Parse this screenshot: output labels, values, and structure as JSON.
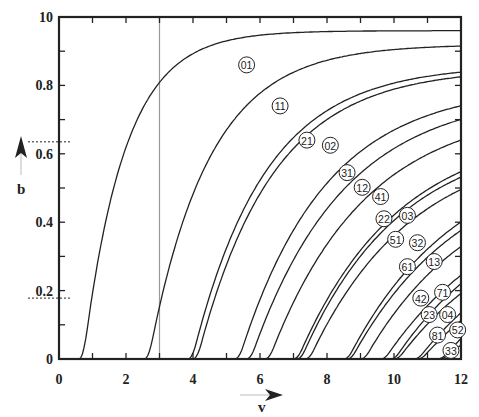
{
  "chart_data": {
    "type": "line",
    "title": "",
    "xlabel": "v",
    "ylabel": "b",
    "xlim": [
      0,
      12
    ],
    "ylim": [
      0,
      1.0
    ],
    "x_ticks": [
      0,
      2,
      4,
      6,
      8,
      10,
      12
    ],
    "x_tick_labels": [
      "0",
      "2",
      "4",
      "6",
      "8",
      "10",
      "12"
    ],
    "y_ticks": [
      0,
      0.2,
      0.4,
      0.6,
      0.8,
      1.0
    ],
    "y_tick_labels": [
      "0",
      "0.2",
      "0.4",
      "0.6",
      "0.8",
      "10"
    ],
    "grid": false,
    "legend": "inline circled labels on curves",
    "reference_lines": {
      "vertical_v": 3.0,
      "vertical_color": "#999999",
      "dashed_b_upper": 0.635,
      "dashed_b_lower": 0.178
    },
    "series": [
      {
        "name": "01",
        "v_start": 0.6,
        "b_end": 0.96,
        "k": 0.58,
        "label_at": [
          5.6,
          0.86
        ]
      },
      {
        "name": "11",
        "v_start": 2.55,
        "b_end": 0.92,
        "k": 0.4,
        "label_at": [
          6.6,
          0.74
        ]
      },
      {
        "name": "21",
        "v_start": 3.85,
        "b_end": 0.86,
        "k": 0.33,
        "label_at": [
          7.4,
          0.64
        ]
      },
      {
        "name": "02",
        "v_start": 4.0,
        "b_end": 0.85,
        "k": 0.32,
        "label_at": [
          8.1,
          0.625
        ]
      },
      {
        "name": "31",
        "v_start": 5.25,
        "b_end": 0.8,
        "k": 0.28,
        "label_at": [
          8.6,
          0.545
        ]
      },
      {
        "name": "12",
        "v_start": 5.6,
        "b_end": 0.78,
        "k": 0.26,
        "label_at": [
          9.05,
          0.502
        ]
      },
      {
        "name": "41",
        "v_start": 6.15,
        "b_end": 0.74,
        "k": 0.25,
        "label_at": [
          9.6,
          0.475
        ]
      },
      {
        "name": "22",
        "v_start": 7.0,
        "b_end": 0.68,
        "k": 0.24,
        "label_at": [
          9.7,
          0.41
        ]
      },
      {
        "name": "03",
        "v_start": 7.1,
        "b_end": 0.66,
        "k": 0.245,
        "label_at": [
          10.4,
          0.42
        ]
      },
      {
        "name": "51",
        "v_start": 7.35,
        "b_end": 0.64,
        "k": 0.235,
        "label_at": [
          10.05,
          0.35
        ]
      },
      {
        "name": "32",
        "v_start": 8.5,
        "b_end": 0.62,
        "k": 0.22,
        "label_at": [
          10.7,
          0.34
        ]
      },
      {
        "name": "61",
        "v_start": 8.6,
        "b_end": 0.6,
        "k": 0.215,
        "label_at": [
          10.4,
          0.27
        ]
      },
      {
        "name": "13",
        "v_start": 9.0,
        "b_end": 0.56,
        "k": 0.22,
        "label_at": [
          11.2,
          0.285
        ]
      },
      {
        "name": "42",
        "v_start": 9.6,
        "b_end": 0.52,
        "k": 0.2,
        "label_at": [
          10.8,
          0.178
        ]
      },
      {
        "name": "71",
        "v_start": 9.9,
        "b_end": 0.5,
        "k": 0.21,
        "label_at": [
          11.45,
          0.195
        ]
      },
      {
        "name": "23",
        "v_start": 10.0,
        "b_end": 0.47,
        "k": 0.2,
        "label_at": [
          11.05,
          0.13
        ]
      },
      {
        "name": "04",
        "v_start": 10.6,
        "b_end": 0.45,
        "k": 0.2,
        "label_at": [
          11.6,
          0.13
        ]
      },
      {
        "name": "81",
        "v_start": 10.7,
        "b_end": 0.4,
        "k": 0.2,
        "label_at": [
          11.3,
          0.07
        ]
      },
      {
        "name": "52",
        "v_start": 11.3,
        "b_end": 0.4,
        "k": 0.2,
        "label_at": [
          11.9,
          0.085
        ]
      },
      {
        "name": "33",
        "v_start": 11.35,
        "b_end": 0.3,
        "k": 0.2,
        "label_at": [
          11.7,
          0.025
        ]
      }
    ]
  },
  "axes": {
    "x_label": "v",
    "y_label": "b"
  }
}
